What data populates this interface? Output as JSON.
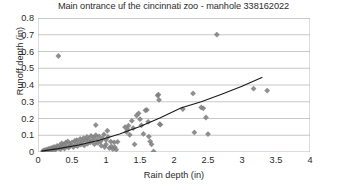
{
  "chart_data": {
    "type": "scatter",
    "title": "Main ontrance uf the cincinnati zoo - manhole 338162022",
    "xlabel": "Rain depth (in)",
    "ylabel": "Runoff depth (in)",
    "xlim": [
      0,
      4
    ],
    "ylim": [
      0,
      0.8
    ],
    "xticks": [
      "0",
      "0.5",
      "1",
      "1.5",
      "2",
      "2.5",
      "3",
      "3.5",
      "4"
    ],
    "xtick_values": [
      0,
      0.5,
      1,
      1.5,
      2,
      2.5,
      3,
      3.5,
      4
    ],
    "yticks": [
      "0",
      "0.1",
      "0.2",
      "0.3",
      "0.4",
      "0.5",
      "0.6",
      "0.7",
      "0.8"
    ],
    "ytick_values": [
      0,
      0.1,
      0.2,
      0.3,
      0.4,
      0.5,
      0.6,
      0.7,
      0.8
    ],
    "grid": "horizontal",
    "legend": "none",
    "marker": "diamond",
    "marker_color": "#808080",
    "trendline_color": "#1a1a1a",
    "trendline_type": "polynomial",
    "series": [
      {
        "name": "Rain vs Runoff",
        "points": [
          [
            0.07,
            0.005
          ],
          [
            0.09,
            0.01
          ],
          [
            0.1,
            0.008
          ],
          [
            0.12,
            0.014
          ],
          [
            0.13,
            0.006
          ],
          [
            0.15,
            0.018
          ],
          [
            0.16,
            0.011
          ],
          [
            0.18,
            0.022
          ],
          [
            0.19,
            0.009
          ],
          [
            0.21,
            0.026
          ],
          [
            0.22,
            0.015
          ],
          [
            0.24,
            0.031
          ],
          [
            0.25,
            0.012
          ],
          [
            0.27,
            0.02
          ],
          [
            0.28,
            0.036
          ],
          [
            0.3,
            0.573
          ],
          [
            0.3,
            0.024
          ],
          [
            0.32,
            0.041
          ],
          [
            0.33,
            0.017
          ],
          [
            0.35,
            0.052
          ],
          [
            0.36,
            0.028
          ],
          [
            0.38,
            0.046
          ],
          [
            0.39,
            0.021
          ],
          [
            0.41,
            0.057
          ],
          [
            0.42,
            0.033
          ],
          [
            0.44,
            0.063
          ],
          [
            0.45,
            0.026
          ],
          [
            0.47,
            0.048
          ],
          [
            0.48,
            0.037
          ],
          [
            0.5,
            0.058
          ],
          [
            0.52,
            0.03
          ],
          [
            0.54,
            0.066
          ],
          [
            0.55,
            0.043
          ],
          [
            0.57,
            0.071
          ],
          [
            0.58,
            0.035
          ],
          [
            0.6,
            0.052
          ],
          [
            0.62,
            0.078
          ],
          [
            0.63,
            0.044
          ],
          [
            0.65,
            0.061
          ],
          [
            0.67,
            0.083
          ],
          [
            0.68,
            0.039
          ],
          [
            0.7,
            0.069
          ],
          [
            0.72,
            0.09
          ],
          [
            0.73,
            0.05
          ],
          [
            0.75,
            0.075
          ],
          [
            0.77,
            0.058
          ],
          [
            0.78,
            0.096
          ],
          [
            0.8,
            0.066
          ],
          [
            0.82,
            0.085
          ],
          [
            0.83,
            0.047
          ],
          [
            0.85,
            0.161
          ],
          [
            0.85,
            0.1
          ],
          [
            0.87,
            0.072
          ],
          [
            0.88,
            0.055
          ],
          [
            0.9,
            0.093
          ],
          [
            0.92,
            0.064
          ],
          [
            0.93,
            0.038
          ],
          [
            0.95,
            0.081
          ],
          [
            0.97,
            0.105
          ],
          [
            0.98,
            0.03
          ],
          [
            1.0,
            0.072
          ],
          [
            1.0,
            0.046
          ],
          [
            1.02,
            0.127
          ],
          [
            1.03,
            0.09
          ],
          [
            1.05,
            0.024
          ],
          [
            1.07,
            0.062
          ],
          [
            1.08,
            0.034
          ],
          [
            1.1,
            0.018
          ],
          [
            1.12,
            0.058
          ],
          [
            1.13,
            0.029
          ],
          [
            1.15,
            0.014
          ],
          [
            1.17,
            0.061
          ],
          [
            1.28,
            0.148
          ],
          [
            1.3,
            0.12
          ],
          [
            1.32,
            0.134
          ],
          [
            1.33,
            0.157
          ],
          [
            1.35,
            0.102
          ],
          [
            1.38,
            0.186
          ],
          [
            1.4,
            0.143
          ],
          [
            1.42,
            0.046
          ],
          [
            1.45,
            0.218
          ],
          [
            1.48,
            0.231
          ],
          [
            1.5,
            0.196
          ],
          [
            1.52,
            0.159
          ],
          [
            1.55,
            0.108
          ],
          [
            1.58,
            0.249
          ],
          [
            1.6,
            0.251
          ],
          [
            1.62,
            0.18
          ],
          [
            1.63,
            0.092
          ],
          [
            1.65,
            0.063
          ],
          [
            1.67,
            0.046
          ],
          [
            1.7,
            0.003
          ],
          [
            1.76,
            0.337
          ],
          [
            1.77,
            0.343
          ],
          [
            1.78,
            0.311
          ],
          [
            1.79,
            0.166
          ],
          [
            1.8,
            0.163
          ],
          [
            2.13,
            0.256
          ],
          [
            2.28,
            0.35
          ],
          [
            2.3,
            0.117
          ],
          [
            2.4,
            0.266
          ],
          [
            2.43,
            0.261
          ],
          [
            2.47,
            0.206
          ],
          [
            2.5,
            0.107
          ],
          [
            2.63,
            0.701
          ],
          [
            3.17,
            0.378
          ],
          [
            3.37,
            0.367
          ]
        ]
      }
    ],
    "trendline": [
      [
        0.05,
        0.005
      ],
      [
        0.3,
        0.02
      ],
      [
        0.6,
        0.042
      ],
      [
        0.9,
        0.07
      ],
      [
        1.2,
        0.108
      ],
      [
        1.5,
        0.152
      ],
      [
        1.8,
        0.205
      ],
      [
        2.1,
        0.263
      ],
      [
        2.4,
        0.3
      ],
      [
        2.7,
        0.345
      ],
      [
        3.0,
        0.392
      ],
      [
        3.3,
        0.447
      ]
    ]
  }
}
